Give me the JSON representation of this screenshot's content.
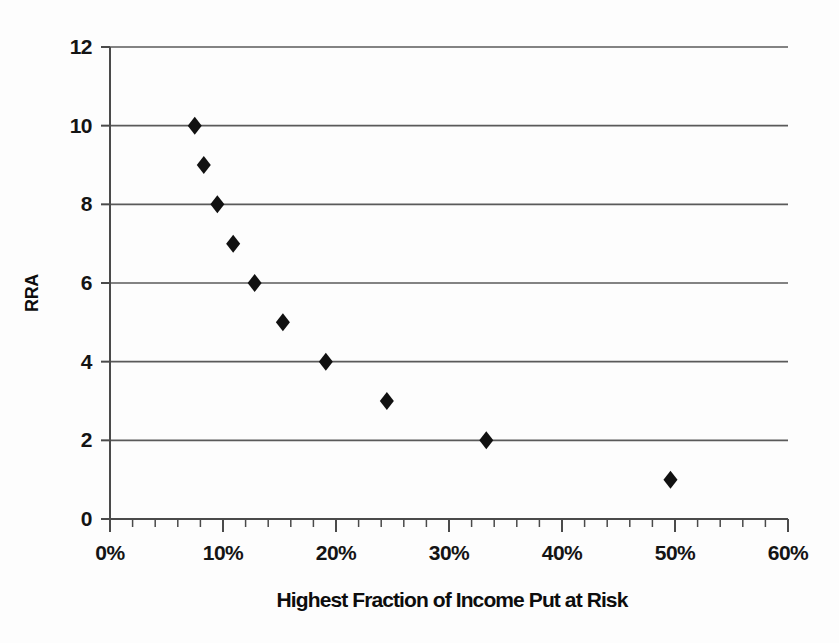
{
  "chart_data": {
    "type": "scatter",
    "title": "",
    "xlabel": "Highest Fraction of Income Put at Risk",
    "ylabel": "RRA",
    "xlim": [
      0,
      60
    ],
    "ylim": [
      0,
      12
    ],
    "grid": true,
    "grid_axis": "y",
    "legend": false,
    "marker": "diamond",
    "marker_color": "#111111",
    "x_tick_labels": [
      "0%",
      "10%",
      "20%",
      "30%",
      "40%",
      "50%",
      "60%"
    ],
    "x_tick_values": [
      0,
      10,
      20,
      30,
      40,
      50,
      60
    ],
    "x_minor_tick_step": 2,
    "y_tick_labels": [
      "0",
      "2",
      "4",
      "6",
      "8",
      "10",
      "12"
    ],
    "y_tick_values": [
      0,
      2,
      4,
      6,
      8,
      10,
      12
    ],
    "x": [
      7.5,
      8.3,
      9.5,
      10.9,
      12.8,
      15.3,
      19.1,
      24.5,
      33.3,
      49.6
    ],
    "y": [
      10,
      9,
      8,
      7,
      6,
      5,
      4,
      3,
      2,
      1
    ],
    "points": [
      {
        "x": 7.5,
        "y": 10
      },
      {
        "x": 8.3,
        "y": 9
      },
      {
        "x": 9.5,
        "y": 8
      },
      {
        "x": 10.9,
        "y": 7
      },
      {
        "x": 12.8,
        "y": 6
      },
      {
        "x": 15.3,
        "y": 5
      },
      {
        "x": 19.1,
        "y": 4
      },
      {
        "x": 24.5,
        "y": 3
      },
      {
        "x": 33.3,
        "y": 2
      },
      {
        "x": 49.6,
        "y": 1
      }
    ],
    "colors": {
      "background": "#fdfdfd",
      "axis": "#4a4a4a",
      "gridline": "#5a5a5a",
      "marker": "#111111",
      "text": "#111111"
    }
  }
}
